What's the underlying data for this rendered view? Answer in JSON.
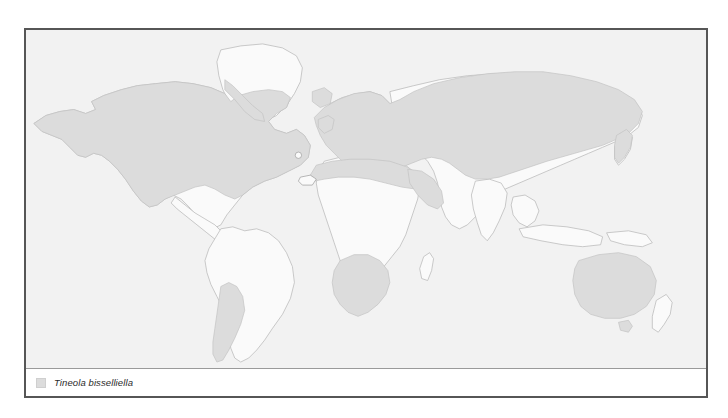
{
  "figure": {
    "kind": "species-distribution-world-map",
    "projection": "equirectangular",
    "frame_color": "#565656",
    "ocean_color": "#f2f2f2",
    "land_unshaded_color": "#fafafa",
    "land_outline_color": "#b4b4b4",
    "distribution_fill_color": "#dcdcdc",
    "distribution_outline_color": "#c3c3c3"
  },
  "legend": {
    "swatch_color": "#dcdcdc",
    "swatch_name": "distribution-swatch",
    "label": "Tineola bisselliella"
  },
  "map_data": {
    "type": "choropleth-presence",
    "title": "Tineola bisselliella",
    "shaded_meaning": "recorded distribution",
    "shaded_regions": [
      "Alaska",
      "Canada",
      "United States",
      "Iceland",
      "Greenland southwest coastal strip",
      "Southern Chile",
      "Southern Argentina",
      "British Isles",
      "Scandinavia",
      "Continental Europe",
      "Iberian Peninsula",
      "Italy",
      "Balkans",
      "Turkey",
      "European Russia",
      "Siberia",
      "Central Asia",
      "Mongolia",
      "Northern China",
      "Korea",
      "Japan",
      "Morocco",
      "Algeria",
      "Tunisia",
      "Libya",
      "Egypt",
      "Arabian Peninsula",
      "Iran",
      "Afghanistan",
      "Southern Africa",
      "Zambia",
      "Zimbabwe",
      "Angola highlands",
      "Australia"
    ],
    "unshaded_regions": [
      "Mexico",
      "Central America",
      "Caribbean",
      "Amazonia",
      "Northern South America",
      "Sahel",
      "Tropical Central Africa",
      "West Africa",
      "Madagascar",
      "India",
      "Southeast Asia",
      "Indonesia",
      "New Guinea",
      "New Zealand",
      "Greenland interior"
    ]
  }
}
